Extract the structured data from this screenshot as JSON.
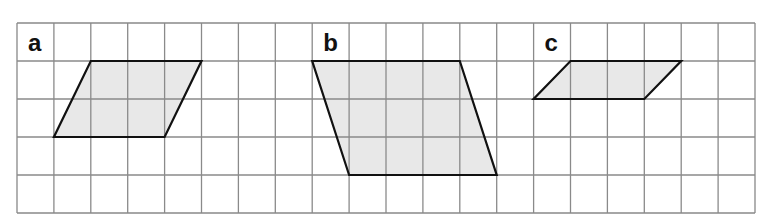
{
  "grid": {
    "left": 17,
    "top": 23,
    "right": 755,
    "bottom": 213,
    "cols": 20,
    "rows": 5,
    "line_color": "#8a8a8a",
    "border_color": "#888888"
  },
  "style": {
    "shape_fill": "#e8e8e8",
    "shape_stroke": "#111111"
  },
  "shapes": [
    {
      "label": "a",
      "label_cell": [
        0,
        0
      ],
      "points": [
        [
          2,
          1
        ],
        [
          5,
          1
        ],
        [
          4,
          3
        ],
        [
          1,
          3
        ]
      ]
    },
    {
      "label": "b",
      "label_cell": [
        8,
        0
      ],
      "points": [
        [
          8,
          1
        ],
        [
          12,
          1
        ],
        [
          13,
          4
        ],
        [
          9,
          4
        ]
      ]
    },
    {
      "label": "c",
      "label_cell": [
        14,
        0
      ],
      "points": [
        [
          15,
          1
        ],
        [
          18,
          1
        ],
        [
          17,
          2
        ],
        [
          14,
          2
        ]
      ]
    }
  ]
}
